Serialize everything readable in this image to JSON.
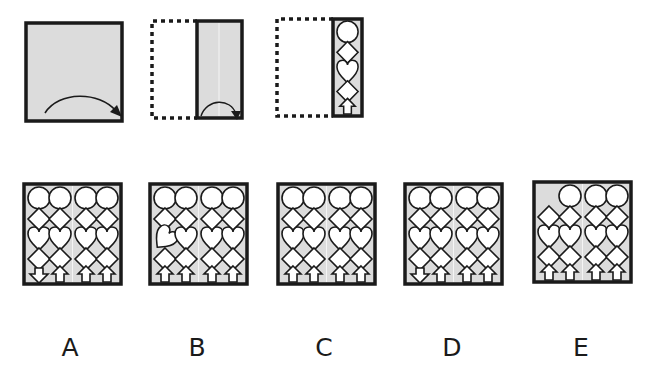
{
  "puzzle": {
    "type": "paper-folding",
    "colors": {
      "paper": "#dcdcdc",
      "border": "#1a1a1a",
      "shape_fill": "#ffffff",
      "fold_line": "#f4f4f4"
    },
    "steps": [
      {
        "id": "step-1",
        "description": "full square sheet with fold arrow curving left to right"
      },
      {
        "id": "step-2",
        "description": "sheet folded in half (left half dotted), fold arrow left to right"
      },
      {
        "id": "step-3",
        "description": "folded strip with cut shapes: circle, diamond, heart, diamond, arrow"
      }
    ],
    "strip_shapes": [
      "circle",
      "diamond",
      "heart",
      "diamond",
      "arrow-up"
    ]
  },
  "options": [
    {
      "label": "A",
      "variant": "first arrow points down"
    },
    {
      "label": "B",
      "variant": "first heart rotated"
    },
    {
      "label": "C",
      "variant": "all arrows point up"
    },
    {
      "label": "D",
      "variant": "first arrow points down, partial"
    },
    {
      "label": "E",
      "variant": "first circle missing"
    }
  ]
}
